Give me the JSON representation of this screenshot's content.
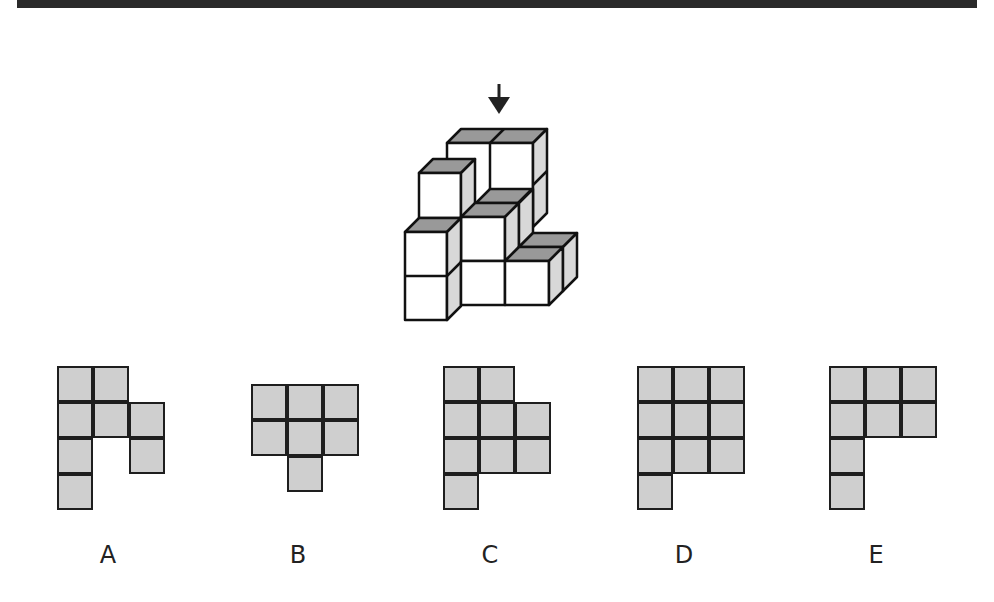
{
  "puzzle": {
    "prompt_icon": "down-arrow-icon",
    "cell_fill": "#cfcfcf",
    "line_color": "#1e1e1e",
    "options": [
      {
        "label": "A",
        "origin": [
          57,
          366
        ],
        "cells": [
          [
            0,
            0
          ],
          [
            0,
            1
          ],
          [
            1,
            0
          ],
          [
            1,
            1
          ],
          [
            1,
            2
          ],
          [
            2,
            0
          ],
          [
            2,
            2
          ],
          [
            3,
            0
          ]
        ]
      },
      {
        "label": "B",
        "origin": [
          251,
          384
        ],
        "cells": [
          [
            0,
            0
          ],
          [
            0,
            1
          ],
          [
            0,
            2
          ],
          [
            1,
            0
          ],
          [
            1,
            1
          ],
          [
            1,
            2
          ],
          [
            2,
            1
          ]
        ]
      },
      {
        "label": "C",
        "origin": [
          443,
          366
        ],
        "cells": [
          [
            0,
            0
          ],
          [
            0,
            1
          ],
          [
            1,
            0
          ],
          [
            1,
            1
          ],
          [
            1,
            2
          ],
          [
            2,
            0
          ],
          [
            2,
            1
          ],
          [
            2,
            2
          ],
          [
            3,
            0
          ]
        ]
      },
      {
        "label": "D",
        "origin": [
          637,
          366
        ],
        "cells": [
          [
            0,
            0
          ],
          [
            0,
            1
          ],
          [
            0,
            2
          ],
          [
            1,
            0
          ],
          [
            1,
            1
          ],
          [
            1,
            2
          ],
          [
            2,
            0
          ],
          [
            2,
            1
          ],
          [
            2,
            2
          ],
          [
            3,
            0
          ]
        ]
      },
      {
        "label": "E",
        "origin": [
          829,
          366
        ],
        "cells": [
          [
            0,
            0
          ],
          [
            0,
            1
          ],
          [
            0,
            2
          ],
          [
            1,
            0
          ],
          [
            1,
            1
          ],
          [
            1,
            2
          ],
          [
            2,
            0
          ],
          [
            3,
            0
          ]
        ]
      }
    ]
  }
}
